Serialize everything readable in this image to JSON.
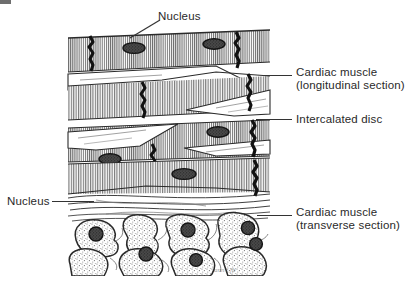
{
  "figure": {
    "artist_signature": "ann/jb",
    "background_color": "#ffffff",
    "ink_color": "#2a2a2a",
    "fill_color": "#d9d9d9",
    "regions": [
      {
        "name": "longitudinal-section",
        "caption": "Striated muscle fibres running horizontally, crossed by dark zig-zag intercalated discs, with oval nuclei."
      },
      {
        "name": "transverse-section",
        "caption": "Irregular polygonal cell profiles with stippled cytoplasm and dark round central nuclei."
      }
    ]
  },
  "labels": [
    {
      "id": "nucleus-top",
      "line1": "Nucleus",
      "line2": "",
      "target": "oval nucleus in upper longitudinal fibre"
    },
    {
      "id": "cardiac-muscle-longitudinal",
      "line1": "Cardiac muscle",
      "line2": "(longitudinal section)",
      "target": "striated fibre band, upper right"
    },
    {
      "id": "intercalated-disc",
      "line1": "Intercalated disc",
      "line2": "",
      "target": "dark zig-zag band crossing fibres"
    },
    {
      "id": "nucleus-left",
      "line1": "Nucleus",
      "line2": "",
      "target": "round nucleus of transverse-section cell"
    },
    {
      "id": "cardiac-muscle-transverse",
      "line1": "Cardiac muscle",
      "line2": "(transverse section)",
      "target": "polygonal cell profile, lower right"
    }
  ]
}
